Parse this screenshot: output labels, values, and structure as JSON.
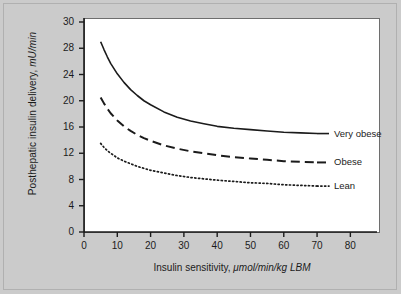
{
  "figure": {
    "background_color": "#cbcbcb",
    "plot_background_color": "#ffffff",
    "axis_color": "#1b1b1b"
  },
  "chart_data": {
    "type": "line",
    "title": "",
    "xlabel_main": "Insulin sensitivity, ",
    "xlabel_units": "μmol/min/kg LBM",
    "ylabel_main": "Posthepatic insulin delivery, ",
    "ylabel_units": "mU/min",
    "xlim": [
      0,
      88
    ],
    "ylim": [
      0,
      32
    ],
    "xticks": [
      0,
      10,
      20,
      30,
      40,
      50,
      60,
      70,
      80
    ],
    "xtick_labels": [
      "0",
      "10",
      "20",
      "30",
      "40",
      "50",
      "60",
      "70",
      "80"
    ],
    "ytick_labels": [
      "30",
      "28",
      "24",
      "20",
      "16",
      "12",
      "8",
      "4",
      "0"
    ],
    "ytick_values": [
      32,
      28,
      24,
      20,
      16,
      12,
      8,
      4,
      0
    ],
    "grid": false,
    "legend_position": "right-inline",
    "series": [
      {
        "name": "Very obese",
        "label": "Very obese",
        "style": "solid",
        "color": "#1b1b1b",
        "x": [
          5,
          6,
          7,
          8,
          10,
          12,
          14,
          16,
          18,
          20,
          24,
          28,
          32,
          36,
          40,
          45,
          50,
          55,
          60,
          65,
          70
        ],
        "values": [
          29.0,
          27.8,
          26.7,
          25.7,
          24.1,
          22.8,
          21.7,
          20.8,
          20.0,
          19.4,
          18.3,
          17.5,
          16.9,
          16.5,
          16.1,
          15.8,
          15.6,
          15.4,
          15.2,
          15.1,
          15.0
        ]
      },
      {
        "name": "Obese",
        "label": "Obese",
        "style": "dashed",
        "color": "#1b1b1b",
        "x": [
          5,
          6,
          7,
          8,
          10,
          12,
          14,
          16,
          18,
          20,
          24,
          28,
          32,
          36,
          40,
          45,
          50,
          55,
          60,
          65,
          70
        ],
        "values": [
          20.5,
          19.6,
          18.8,
          18.1,
          17.0,
          16.1,
          15.4,
          14.8,
          14.3,
          13.9,
          13.2,
          12.7,
          12.3,
          12.0,
          11.7,
          11.4,
          11.2,
          11.0,
          10.8,
          10.7,
          10.6
        ]
      },
      {
        "name": "Lean",
        "label": "Lean",
        "style": "dotted",
        "color": "#1b1b1b",
        "x": [
          5,
          6,
          7,
          8,
          10,
          12,
          14,
          16,
          18,
          20,
          24,
          28,
          32,
          36,
          40,
          45,
          50,
          55,
          60,
          65,
          70
        ],
        "values": [
          13.5,
          12.9,
          12.4,
          12.0,
          11.3,
          10.8,
          10.4,
          10.0,
          9.7,
          9.4,
          9.0,
          8.6,
          8.3,
          8.1,
          7.9,
          7.7,
          7.5,
          7.4,
          7.2,
          7.1,
          7.0
        ]
      }
    ]
  }
}
